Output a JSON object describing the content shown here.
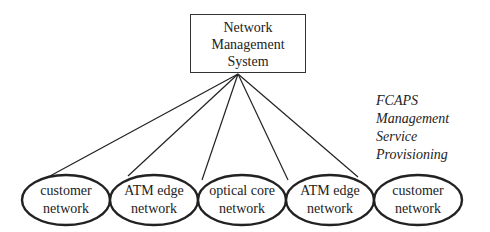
{
  "diagram": {
    "center": {
      "label_lines": [
        "Network",
        "Management",
        "System"
      ]
    },
    "caption_lines": [
      "FCAPS Management",
      "Service Provisioning"
    ],
    "nodes": [
      {
        "line1": "customer",
        "line2": "network",
        "cx": 66
      },
      {
        "line1": "ATM edge",
        "line2": "network",
        "cx": 154
      },
      {
        "line1": "optical core",
        "line2": "network",
        "cx": 242
      },
      {
        "line1": "ATM edge",
        "line2": "network",
        "cx": 330
      },
      {
        "line1": "customer",
        "line2": "network",
        "cx": 418
      }
    ],
    "colors": {
      "stroke": "#222222",
      "background": "#ffffff"
    }
  }
}
